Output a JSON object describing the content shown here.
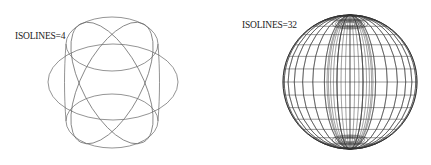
{
  "figures": [
    {
      "label": "ISOLINES=4",
      "isolines": 4
    },
    {
      "label": "ISOLINES=32",
      "isolines": 32
    }
  ],
  "colors": {
    "line": "#555555",
    "dense": "#222222",
    "background": "#ffffff"
  }
}
